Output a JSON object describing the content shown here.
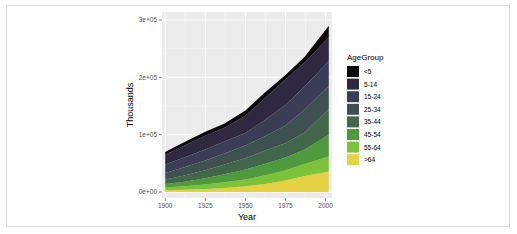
{
  "chart_data": {
    "type": "area",
    "stacked": true,
    "title": "",
    "xlabel": "Year",
    "ylabel": "Thousands",
    "x": [
      1900,
      1912,
      1925,
      1937,
      1950,
      1962,
      1975,
      1987,
      2002
    ],
    "xlim": [
      1898,
      2004
    ],
    "ylim": [
      0,
      300000
    ],
    "x_ticks": [
      "1900",
      "1925",
      "1950",
      "1975",
      "2000"
    ],
    "y_ticks": [
      "0e+00",
      "1e+05",
      "2e+05",
      "3e+05"
    ],
    "grid": true,
    "legend_title": "AgeGroup",
    "legend_position": "right",
    "series": [
      {
        "name": "<5",
        "color": "#0d0a0b",
        "values": [
          5000,
          6000,
          7000,
          7500,
          9000,
          10000,
          8000,
          10000,
          20000
        ]
      },
      {
        "name": "5-14",
        "color": "#2f2841",
        "values": [
          17000,
          21000,
          24000,
          24000,
          30000,
          38000,
          44000,
          42000,
          42000
        ]
      },
      {
        "name": "15-24",
        "color": "#3b3d56",
        "values": [
          15000,
          17000,
          19000,
          21000,
          22000,
          28000,
          36000,
          40000,
          43000
        ]
      },
      {
        "name": "25-34",
        "color": "#3f5050",
        "values": [
          11000,
          14000,
          17000,
          19000,
          22000,
          25000,
          31000,
          40000,
          40000
        ]
      },
      {
        "name": "35-44",
        "color": "#41664a",
        "values": [
          8000,
          11000,
          14000,
          17000,
          20000,
          23000,
          25000,
          30000,
          45000
        ]
      },
      {
        "name": "45-54",
        "color": "#4e9a3d",
        "values": [
          6000,
          8000,
          11000,
          14000,
          17000,
          20000,
          22000,
          25000,
          38000
        ]
      },
      {
        "name": "55-64",
        "color": "#7dc33a",
        "values": [
          5000,
          6000,
          8000,
          10000,
          12000,
          15000,
          18000,
          21000,
          26000
        ]
      },
      {
        "name": ">64",
        "color": "#e4d144",
        "values": [
          3000,
          4000,
          5000,
          7000,
          10000,
          14000,
          20000,
          28000,
          36000
        ]
      }
    ]
  }
}
